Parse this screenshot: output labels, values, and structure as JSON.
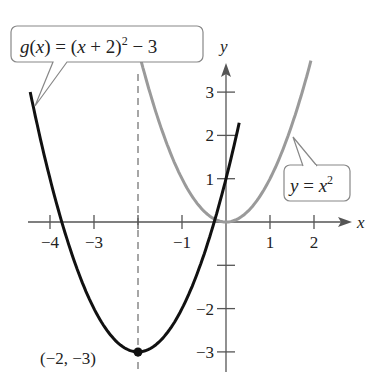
{
  "figure": {
    "type": "function-graph",
    "x_axis_label": "x",
    "y_axis_label": "y",
    "x_ticks": [
      {
        "v": -4,
        "label": "−4"
      },
      {
        "v": -3,
        "label": "−3"
      },
      {
        "v": -2,
        "label": ""
      },
      {
        "v": -1,
        "label": "−1"
      },
      {
        "v": 1,
        "label": "1"
      },
      {
        "v": 2,
        "label": "2"
      }
    ],
    "y_ticks": [
      {
        "v": 3,
        "label": "3"
      },
      {
        "v": 2,
        "label": "2"
      },
      {
        "v": 1,
        "label": "1"
      },
      {
        "v": -1,
        "label": ""
      },
      {
        "v": -2,
        "label": "−2"
      },
      {
        "v": -3,
        "label": "−3"
      }
    ],
    "curves": [
      {
        "name": "g",
        "expression": "g(x) = (x + 2)^2 − 3",
        "color": "#111111",
        "label_text": "g(x) = (x + 2)",
        "label_exp": "2",
        "label_tail": " − 3"
      },
      {
        "name": "f",
        "expression": "y = x^2",
        "color": "#9a9a9a",
        "label_text": "y = x",
        "label_exp": "2"
      }
    ],
    "vertex": {
      "x": -2,
      "y": -3,
      "label": "(−2, −3)"
    },
    "axis_of_symmetry": {
      "x": -2,
      "style": "dashed"
    }
  }
}
